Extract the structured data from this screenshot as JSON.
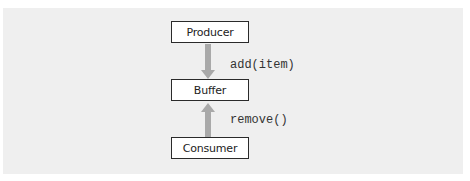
{
  "diagram": {
    "nodes": [
      {
        "id": "producer",
        "label": "Producer"
      },
      {
        "id": "buffer",
        "label": "Buffer"
      },
      {
        "id": "consumer",
        "label": "Consumer"
      }
    ],
    "edges": [
      {
        "from": "producer",
        "to": "buffer",
        "label": "add(item)",
        "direction": "down"
      },
      {
        "from": "consumer",
        "to": "buffer",
        "label": "remove()",
        "direction": "up"
      }
    ],
    "colors": {
      "arrow": "#a9a9a9",
      "box_border": "#2a2a2a",
      "background": "#efefef"
    }
  }
}
